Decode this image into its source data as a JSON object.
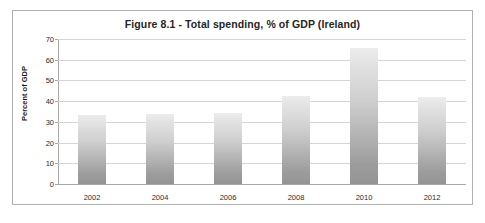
{
  "chart_data": {
    "type": "bar",
    "title": "Figure 8.1 - Total spending, % of GDP (Ireland)",
    "xlabel": "",
    "ylabel": "Percent of GDP",
    "categories": [
      "2002",
      "2004",
      "2006",
      "2008",
      "2010",
      "2012"
    ],
    "values": [
      33.4,
      33.6,
      34.5,
      42.7,
      65.5,
      42.2
    ],
    "ylim": [
      0,
      70
    ],
    "ytick_labels": [
      "0",
      "10",
      "20",
      "30",
      "40",
      "50",
      "60",
      "70"
    ],
    "ytick_values": [
      0,
      10,
      20,
      30,
      40,
      50,
      60,
      70
    ],
    "grid": true,
    "legend": false,
    "series": [
      {
        "name": "Total spending, % of GDP (Ireland)",
        "values": [
          33.4,
          33.6,
          34.5,
          42.7,
          65.5,
          42.2
        ]
      }
    ],
    "colors": {
      "bar_top": "#ececed",
      "bar_bottom": "#949495",
      "gridline": "#d4d4d4",
      "axis": "#a8a8a8",
      "border": "#b0b0b0",
      "text": "#262626",
      "background": "#ffffff"
    }
  }
}
